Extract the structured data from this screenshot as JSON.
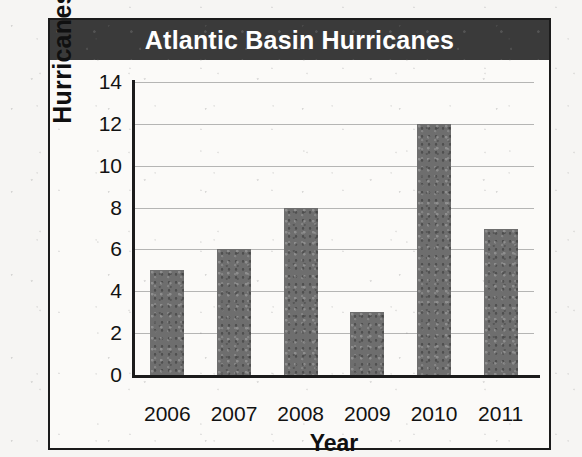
{
  "chart_data": {
    "type": "bar",
    "title": "Atlantic Basin Hurricanes",
    "xlabel": "Year",
    "ylabel": "Hurricanes",
    "categories": [
      "2006",
      "2007",
      "2008",
      "2009",
      "2010",
      "2011"
    ],
    "values": [
      5,
      6,
      8,
      3,
      12,
      7
    ],
    "ylim": [
      0,
      14
    ],
    "ytick_step": 2,
    "yticks": [
      0,
      2,
      4,
      6,
      8,
      10,
      12,
      14
    ],
    "ytick_labels": [
      "0",
      "2",
      "4",
      "6",
      "8",
      "10",
      "12",
      "14"
    ],
    "grid": true,
    "grid_axis": "y",
    "legend": false,
    "legend_position": "none",
    "bar_color": "#6e6e6e",
    "title_banner_color": "#3a3a3a",
    "title_text_color": "#ffffff",
    "axis_color": "#1b1b1b",
    "gridline_color": "#9a9a9a",
    "plot_background": "#fbfaf8",
    "page_background": "#f6f5f3"
  }
}
